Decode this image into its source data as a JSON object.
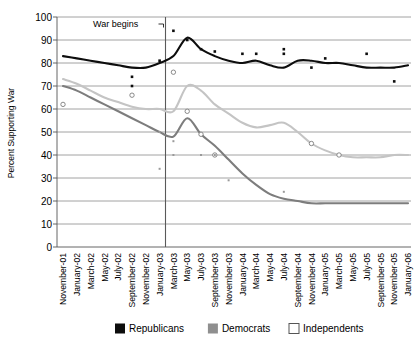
{
  "chart_data": {
    "type": "line",
    "title": "",
    "xlabel": "",
    "ylabel": "Percent Supporting War",
    "ylim": [
      0,
      100
    ],
    "ytick_values": [
      0,
      10,
      20,
      30,
      40,
      50,
      60,
      70,
      80,
      90,
      100
    ],
    "grid": true,
    "legend_position": "bottom",
    "annotations": [
      {
        "text": "War begins",
        "x": "March-03",
        "note": "vertical reference line with leader line"
      }
    ],
    "categories": [
      "November-01",
      "January-02",
      "March-02",
      "May-02",
      "July-02",
      "September-02",
      "November-02",
      "January-03",
      "March-03",
      "May-03",
      "July-03",
      "September-03",
      "November-03",
      "January-04",
      "March-04",
      "May-04",
      "July-04",
      "September-04",
      "November-04",
      "January-05",
      "March-05",
      "May-05",
      "July-05",
      "September-05",
      "November-05",
      "January-06"
    ],
    "series": [
      {
        "name": "Republicans",
        "color": "#0d0d0d",
        "marker": "filled-square",
        "line_values": [
          83,
          82,
          81,
          80,
          79,
          78,
          78,
          80,
          83,
          91,
          86,
          83,
          81,
          80,
          81,
          79,
          78,
          81,
          81,
          80,
          80,
          79,
          78,
          78,
          78,
          79
        ],
        "points": [
          {
            "x": "September-02",
            "y": 74
          },
          {
            "x": "September-02",
            "y": 70
          },
          {
            "x": "January-03",
            "y": 81
          },
          {
            "x": "March-03",
            "y": 94
          },
          {
            "x": "May-03",
            "y": 90
          },
          {
            "x": "July-03",
            "y": 86
          },
          {
            "x": "September-03",
            "y": 85
          },
          {
            "x": "January-04",
            "y": 84
          },
          {
            "x": "March-04",
            "y": 84
          },
          {
            "x": "July-04",
            "y": 86
          },
          {
            "x": "July-04",
            "y": 84
          },
          {
            "x": "November-04",
            "y": 78
          },
          {
            "x": "January-05",
            "y": 82
          },
          {
            "x": "July-05",
            "y": 84
          },
          {
            "x": "November-05",
            "y": 72
          }
        ]
      },
      {
        "name": "Democrats",
        "color": "#7d7d7d",
        "marker": "filled-square",
        "line_values": [
          70,
          68,
          65,
          62,
          59,
          56,
          53,
          50,
          48,
          56,
          49,
          44,
          38,
          32,
          27,
          23,
          21,
          20,
          19,
          19,
          19,
          19,
          19,
          19,
          19,
          19
        ],
        "points": [
          {
            "x": "January-03",
            "y": 50
          },
          {
            "x": "March-03",
            "y": 46
          },
          {
            "x": "March-03",
            "y": 40
          },
          {
            "x": "January-03",
            "y": 34
          },
          {
            "x": "July-03",
            "y": 40
          },
          {
            "x": "September-03",
            "y": 40
          },
          {
            "x": "November-03",
            "y": 29
          },
          {
            "x": "July-04",
            "y": 24
          }
        ]
      },
      {
        "name": "Independents",
        "color": "#c4c4c4",
        "marker": "open-square",
        "line_values": [
          73,
          71,
          68,
          65,
          63,
          61,
          60,
          60,
          59,
          70,
          68,
          62,
          58,
          54,
          52,
          53,
          54,
          50,
          45,
          42,
          40,
          39,
          39,
          39,
          40,
          40
        ],
        "points": [
          {
            "x": "November-01",
            "y": 62
          },
          {
            "x": "September-02",
            "y": 66
          },
          {
            "x": "March-03",
            "y": 76
          },
          {
            "x": "May-03",
            "y": 59
          },
          {
            "x": "July-03",
            "y": 49
          },
          {
            "x": "September-03",
            "y": 40
          },
          {
            "x": "November-04",
            "y": 45
          },
          {
            "x": "March-05",
            "y": 40
          }
        ]
      }
    ]
  },
  "legend": {
    "items": [
      {
        "label": "Republicans",
        "swatch": "black-filled-square"
      },
      {
        "label": "Democrats",
        "swatch": "gray-filled-square"
      },
      {
        "label": "Independents",
        "swatch": "white-outlined-square"
      }
    ]
  }
}
